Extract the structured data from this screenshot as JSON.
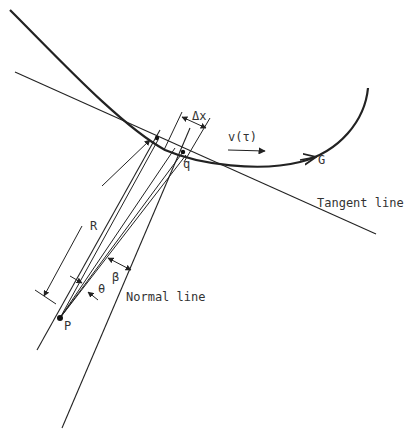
{
  "diagram": {
    "labels": {
      "delta_x": "Δx",
      "velocity": "v(τ)",
      "curve_G": "G",
      "tangent_line": "Tangent line",
      "normal_line": "Normal line",
      "radius": "R",
      "point_q": "q",
      "point_P": "P",
      "angle_theta": "θ",
      "angle_beta": "β"
    },
    "colors": {
      "stroke": "#222222",
      "background": "#ffffff"
    }
  }
}
